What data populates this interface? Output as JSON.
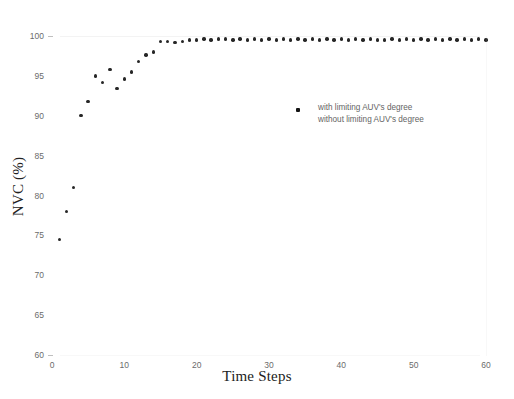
{
  "chart_data": {
    "type": "scatter",
    "title": "",
    "xlabel": "Time Steps",
    "ylabel": "NVC (%)",
    "xlim": [
      0,
      60
    ],
    "ylim": [
      60,
      100
    ],
    "xticks": [
      0,
      10,
      20,
      30,
      40,
      50,
      60
    ],
    "yticks": [
      60,
      65,
      70,
      75,
      80,
      85,
      90,
      95,
      100
    ],
    "grid": false,
    "legend_position": "center-right",
    "legend": [
      "with limiting AUV's degree",
      "without limiting AUV's degree"
    ],
    "marker": "square-dot",
    "marker_color": "#141414",
    "series": [
      {
        "name": "with limiting AUV's degree",
        "x": [
          1,
          2,
          3,
          4,
          5,
          6,
          7,
          8,
          9,
          10,
          11,
          12,
          13,
          14,
          15,
          16,
          17,
          18,
          19,
          20,
          21,
          22,
          23,
          24,
          25,
          26,
          27,
          28,
          29,
          30,
          31,
          32,
          33,
          34,
          35,
          36,
          37,
          38,
          39,
          40,
          41,
          42,
          43,
          44,
          45,
          46,
          47,
          48,
          49,
          50,
          51,
          52,
          53,
          54,
          55,
          56,
          57,
          58,
          59,
          60
        ],
        "values": [
          74.5,
          78.0,
          81.0,
          90.0,
          91.8,
          95.0,
          94.2,
          95.8,
          93.4,
          94.6,
          95.5,
          96.8,
          97.6,
          98.0,
          99.3,
          99.3,
          99.2,
          99.3,
          99.5,
          99.5,
          99.6,
          99.5,
          99.6,
          99.6,
          99.5,
          99.6,
          99.5,
          99.6,
          99.5,
          99.6,
          99.5,
          99.6,
          99.5,
          99.6,
          99.5,
          99.6,
          99.5,
          99.6,
          99.5,
          99.6,
          99.5,
          99.6,
          99.5,
          99.6,
          99.5,
          99.5,
          99.6,
          99.5,
          99.6,
          99.5,
          99.6,
          99.5,
          99.6,
          99.5,
          99.6,
          99.5,
          99.6,
          99.5,
          99.6,
          99.5
        ]
      }
    ]
  }
}
